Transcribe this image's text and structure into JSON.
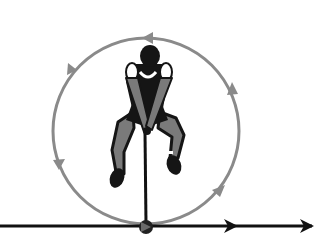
{
  "diagram": {
    "colors": {
      "background": "#ffffff",
      "circle_path": "#8a8a8a",
      "line": "#111111",
      "athlete_dark": "#151515",
      "athlete_mid": "#7a7a7a",
      "athlete_light": "#ffffff"
    },
    "circle": {
      "cx": 146,
      "cy": 131,
      "r": 93,
      "direction": "counter-clockwise"
    },
    "circle_arrows": [
      {
        "position": "top",
        "angle_deg": 270,
        "points": "left"
      },
      {
        "position": "upper-left",
        "angle_deg": 215,
        "points": "down-left"
      },
      {
        "position": "lower-left",
        "angle_deg": 158,
        "points": "down"
      },
      {
        "position": "lower-right",
        "angle_deg": 38,
        "points": "up-right"
      },
      {
        "position": "upper-right",
        "angle_deg": 330,
        "points": "up"
      }
    ],
    "release_line": {
      "y": 226,
      "x_start": 0,
      "x_end": 314,
      "arrows_at_x": [
        234,
        312
      ]
    },
    "hammer": {
      "ball_x": 146,
      "ball_y": 226,
      "handle_x": 146,
      "handle_y": 133
    }
  }
}
